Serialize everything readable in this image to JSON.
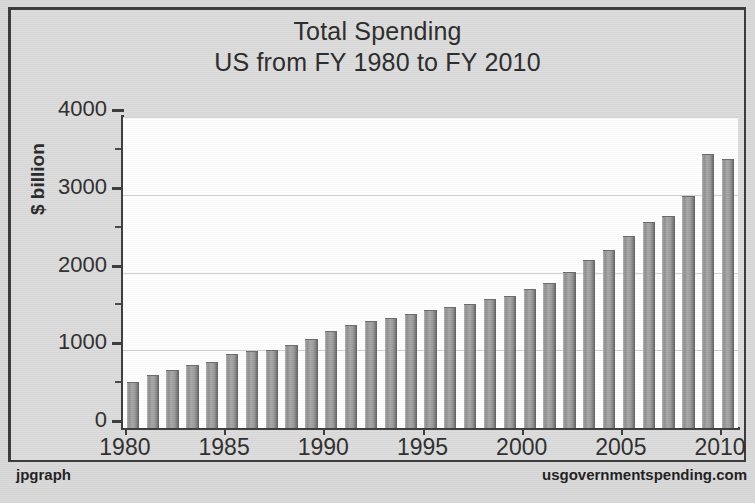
{
  "chart_data": {
    "type": "bar",
    "title": "Total Spending",
    "subtitle": "US from FY 1980 to FY 2010",
    "xlabel": "",
    "ylabel": "$ billion",
    "ylim": [
      0,
      4000
    ],
    "xlim": [
      1979.5,
      2010.5
    ],
    "grid": true,
    "legend": false,
    "y_ticks": [
      0,
      1000,
      2000,
      3000,
      4000
    ],
    "y_tick_labels": [
      "0",
      "1000",
      "2000",
      "3000",
      "4000"
    ],
    "y_minor_ticks": [
      500,
      1500,
      2500,
      3500
    ],
    "x_ticks": [
      1980,
      1985,
      1990,
      1995,
      2000,
      2005,
      2010
    ],
    "x_tick_labels": [
      "1980",
      "1985",
      "1990",
      "1995",
      "2000",
      "2005",
      "2010"
    ],
    "categories": [
      "1980",
      "1981",
      "1982",
      "1983",
      "1984",
      "1985",
      "1986",
      "1987",
      "1988",
      "1989",
      "1990",
      "1991",
      "1992",
      "1993",
      "1994",
      "1995",
      "1996",
      "1997",
      "1998",
      "1999",
      "2000",
      "2001",
      "2002",
      "2003",
      "2004",
      "2005",
      "2006",
      "2007",
      "2008",
      "2009",
      "2010"
    ],
    "values": [
      590,
      678,
      746,
      808,
      851,
      946,
      990,
      1004,
      1064,
      1143,
      1253,
      1324,
      1382,
      1409,
      1461,
      1516,
      1560,
      1601,
      1653,
      1702,
      1789,
      1863,
      2011,
      2160,
      2293,
      2472,
      2655,
      2729,
      2983,
      3518,
      3456
    ],
    "series_name": "Total Spending",
    "bar_color": "#9a9a9a"
  },
  "footer": {
    "left": "jpgraph",
    "right": "usgovernmentspending.com"
  },
  "colors": {
    "page_background": "#d9d9d9",
    "plot_background": "#ffffff",
    "frame": "#3a3a3a",
    "gridline": "#d0d0d0",
    "text": "#2c2c2c"
  }
}
